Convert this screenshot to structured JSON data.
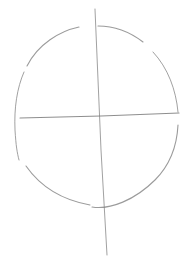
{
  "canvas": {
    "width": 190,
    "height": 277,
    "background": "#ffffff"
  },
  "sketch": {
    "description": "Pencil sketch of a head construction: oval with vertical and horizontal guide lines",
    "stroke_color": "#8a8a8a",
    "stroke_color_light": "#b4b4b4"
  }
}
